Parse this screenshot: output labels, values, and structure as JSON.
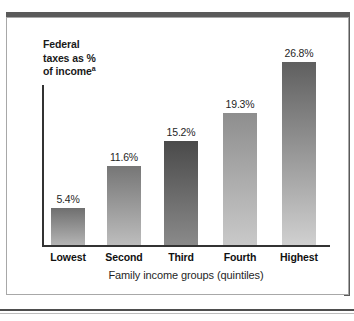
{
  "figure": {
    "y_axis_title_line1": "Federal",
    "y_axis_title_line2": "taxes as %",
    "y_axis_title_line3": "of income",
    "y_axis_title_superscript": "a",
    "x_axis_title": "Family income groups (quintiles)",
    "frame_color": "#5a5a5a",
    "axis_color": "#333333",
    "background": "#ffffff"
  },
  "chart_data": {
    "type": "bar",
    "title": "",
    "subtitle": "",
    "xlabel": "Family income groups (quintiles)",
    "ylabel": "Federal taxes as % of incomea",
    "categories": [
      "Lowest",
      "Second",
      "Third",
      "Fourth",
      "Highest"
    ],
    "values": [
      5.4,
      11.6,
      15.2,
      19.3,
      26.8
    ],
    "value_labels": [
      "5.4%",
      "11.6%",
      "15.2%",
      "19.3%",
      "26.8%"
    ],
    "ylim": [
      0,
      29
    ],
    "grid": false,
    "legend": "none",
    "bar_colors_top": [
      "#6f6f6f",
      "#767676",
      "#4a4a4a",
      "#8e8e8e",
      "#5f5f5f"
    ],
    "bar_colors_bottom": [
      "#b4b4b4",
      "#bdbdbd",
      "#8a8a8a",
      "#c9c9c9",
      "#d0d0d0"
    ]
  }
}
